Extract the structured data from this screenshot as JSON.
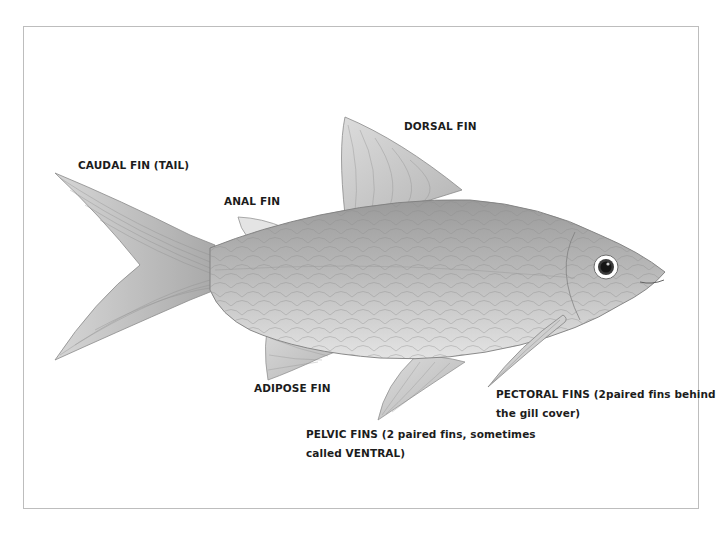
{
  "diagram": {
    "frame_color": "#bdbdbd",
    "ink_color": "#1c1c1c",
    "labels": {
      "caudal": {
        "text": "CAUDAL FIN (TAIL)"
      },
      "dorsal": {
        "text": "DORSAL FIN"
      },
      "anal": {
        "text": "ANAL FIN"
      },
      "adipose": {
        "text": "ADIPOSE FIN"
      },
      "pectoral": {
        "line1": "PECTORAL FINS (2paired fins behind",
        "line2": "the gill cover)"
      },
      "pelvic": {
        "line1": "PELVIC FINS (2 paired fins, sometimes",
        "line2": "called VENTRAL)"
      }
    }
  }
}
